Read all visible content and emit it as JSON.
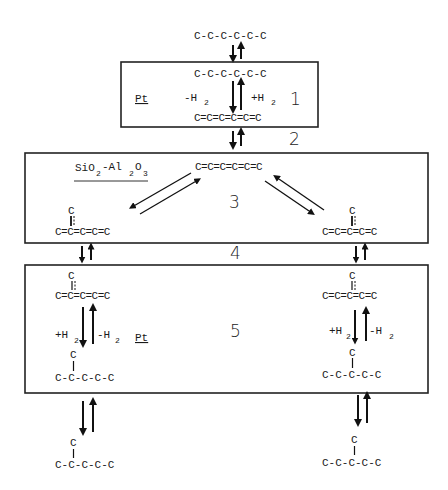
{
  "top": {
    "molecule": "C-C-C-C-C-C"
  },
  "box1": {
    "catalyst": "Pt",
    "step": "1",
    "saturated": "C-C-C-C-C-C",
    "unsaturated": "C=C=C=C=C=C",
    "forward": "-H",
    "forward_sub": "2",
    "reverse": "+H",
    "reverse_sub": "2"
  },
  "step2": "2",
  "box2": {
    "catalyst_a": "SiO",
    "catalyst_a_sub": "2",
    "catalyst_dash": "-Al",
    "catalyst_b_sub": "2",
    "catalyst_c": "O",
    "catalyst_c_sub": "3",
    "step": "3",
    "center": "C=C=C=C=C=C",
    "left_branch": "C",
    "left_chain": "C=C=C=C=C",
    "right_branch": "C",
    "right_chain": "C=C=C=C=C"
  },
  "step4": "4",
  "box3": {
    "catalyst": "Pt",
    "step": "5",
    "left": {
      "branch_top": "C",
      "chain_top": "C=C=C=C=C",
      "hydro": "+H",
      "hydro_sub": "2",
      "dehydro": "-H",
      "dehydro_sub": "2",
      "branch_bottom": "C",
      "chain_bottom": "C-C-C-C-C"
    },
    "right": {
      "branch_top": "C",
      "chain_top": "C=C=C=C=C",
      "hydro": "+H",
      "hydro_sub": "2",
      "dehydro": "-H",
      "dehydro_sub": "2",
      "branch_bottom": "C",
      "chain_bottom": "C-C-C-C-C"
    }
  },
  "bottom": {
    "left_branch": "C",
    "left_chain": "C-C-C-C-C",
    "right_branch": "C",
    "right_chain": "C-C-C-C-C"
  }
}
